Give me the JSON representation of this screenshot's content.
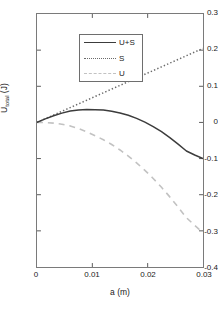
{
  "chart_data": {
    "type": "line",
    "title": "",
    "xlabel": "a (m)",
    "ylabel": "U_total (J)",
    "ylabel_base": "U",
    "ylabel_sub": "total",
    "ylabel_unit": " (J)",
    "xlim": [
      0,
      0.03
    ],
    "ylim": [
      -0.4,
      0.3
    ],
    "grid": false,
    "legend_position": "upper-left",
    "xticks": [
      0,
      0.01,
      0.02,
      0.03
    ],
    "xtick_labels": [
      "0",
      "0.01",
      "0.02",
      "0.03"
    ],
    "yticks": [
      0.3,
      0.2,
      0.1,
      0,
      -0.1,
      -0.2,
      -0.3,
      -0.4
    ],
    "ytick_labels": [
      "0.3",
      "0.2",
      "0.1",
      "0",
      "-0.1",
      "-0.2",
      "-0.3",
      "-0.4"
    ],
    "x": [
      0,
      0.0015,
      0.003,
      0.0045,
      0.006,
      0.0075,
      0.009,
      0.0105,
      0.012,
      0.0135,
      0.015,
      0.0165,
      0.018,
      0.0195,
      0.021,
      0.0225,
      0.024,
      0.0255,
      0.027,
      0.0285,
      0.03
    ],
    "series": [
      {
        "name": "U+S",
        "label": "U+S",
        "style": "solid",
        "color": "#3c3c3c",
        "values": [
          0,
          0.0099,
          0.0186,
          0.0258,
          0.0314,
          0.0345,
          0.0355,
          0.0352,
          0.0341,
          0.0312,
          0.0263,
          0.0197,
          0.0112,
          0.0008,
          -0.0115,
          -0.0257,
          -0.042,
          -0.0601,
          -0.079,
          -0.09,
          -0.1
        ]
      },
      {
        "name": "S",
        "label": "S",
        "style": "dotted",
        "color": "#6a6a6a",
        "values": [
          0,
          0.01025,
          0.0205,
          0.0308,
          0.041,
          0.0513,
          0.0615,
          0.0718,
          0.082,
          0.0923,
          0.1025,
          0.1128,
          0.123,
          0.1333,
          0.1435,
          0.1538,
          0.164,
          0.1743,
          0.1845,
          0.1948,
          0.205
        ]
      },
      {
        "name": "U",
        "label": "U",
        "style": "dashed",
        "color": "#c2c2c2",
        "values": [
          0,
          -0.00035,
          -0.0019,
          -0.005,
          -0.0096,
          -0.0168,
          -0.026,
          -0.0366,
          -0.0479,
          -0.0611,
          -0.0762,
          -0.0931,
          -0.1118,
          -0.1325,
          -0.155,
          -0.1795,
          -0.206,
          -0.2344,
          -0.2635,
          -0.2848,
          -0.305
        ]
      }
    ],
    "legend_entries": [
      "U+S",
      "S",
      "U"
    ],
    "colors": {
      "axis": "#7a7a7a",
      "text": "#1a1a1a",
      "u_plus_s": "#3c3c3c",
      "s": "#6a6a6a",
      "u": "#c2c2c2",
      "background": "#ffffff"
    }
  }
}
